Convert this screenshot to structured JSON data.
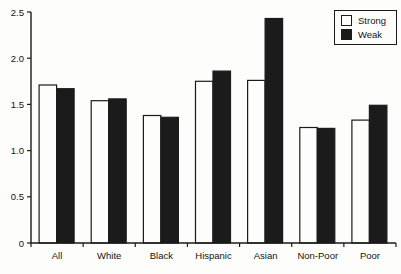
{
  "figure": {
    "background": "#fdfdfc",
    "ink": "#1b1b1b"
  },
  "chart_data": {
    "type": "bar",
    "categories": [
      "All",
      "White",
      "Black",
      "Hispanic",
      "Asian",
      "Non-Poor",
      "Poor"
    ],
    "series": [
      {
        "name": "Strong",
        "fill": "#fdfdfc",
        "values": [
          1.71,
          1.54,
          1.38,
          1.75,
          1.76,
          1.25,
          1.33
        ]
      },
      {
        "name": "Weak",
        "fill": "#1b1b1b",
        "values": [
          1.67,
          1.56,
          1.36,
          1.86,
          2.43,
          1.24,
          1.49
        ]
      }
    ],
    "ylim": [
      0,
      2.5
    ],
    "ytick_values": [
      0,
      0.5,
      1.0,
      1.5,
      2.0,
      2.5
    ],
    "ytick_labels": [
      "0",
      "0.5",
      "1.0",
      "1.5",
      "2.0",
      "2.5"
    ],
    "grid": false,
    "legend_position": "top-right"
  }
}
